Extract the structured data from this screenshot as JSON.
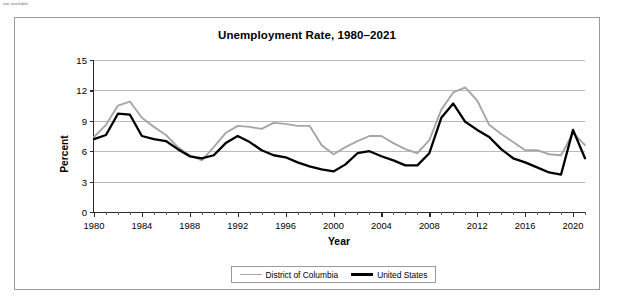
{
  "note": {
    "text": "not available."
  },
  "chart_data": {
    "type": "line",
    "title": "Unemployment Rate, 1980–2021",
    "xlabel": "Year",
    "ylabel": "Percent",
    "xlim": [
      1980,
      2021
    ],
    "ylim": [
      0,
      15
    ],
    "yticks": [
      0,
      3,
      6,
      9,
      12,
      15
    ],
    "xticks": [
      1980,
      1984,
      1988,
      1992,
      1996,
      2000,
      2004,
      2008,
      2012,
      2016,
      2020
    ],
    "xtick_labels": [
      "1980",
      "1984",
      "1988",
      "1992",
      "1996",
      "2000",
      "2004",
      "2008",
      "2012",
      "2016",
      "2020"
    ],
    "ytick_labels": [
      "0",
      "3",
      "6",
      "9",
      "12",
      "15"
    ],
    "grid": "horizontal",
    "legend_position": "bottom-center",
    "x": [
      1980,
      1981,
      1982,
      1983,
      1984,
      1985,
      1986,
      1987,
      1988,
      1989,
      1990,
      1991,
      1992,
      1993,
      1994,
      1995,
      1996,
      1997,
      1998,
      1999,
      2000,
      2001,
      2002,
      2003,
      2004,
      2005,
      2006,
      2007,
      2008,
      2009,
      2010,
      2011,
      2012,
      2013,
      2014,
      2015,
      2016,
      2017,
      2018,
      2019,
      2020,
      2021
    ],
    "series": [
      {
        "name": "District of Columbia",
        "color": "#a6a6a6",
        "values": [
          7.4,
          8.6,
          10.5,
          10.9,
          9.3,
          8.4,
          7.6,
          6.4,
          5.6,
          5.1,
          6.4,
          7.8,
          8.5,
          8.4,
          8.2,
          8.8,
          8.7,
          8.5,
          8.5,
          6.6,
          5.7,
          6.4,
          7.0,
          7.5,
          7.5,
          6.8,
          6.2,
          5.8,
          7.1,
          10.1,
          11.8,
          12.3,
          11.0,
          8.6,
          7.7,
          6.9,
          6.1,
          6.1,
          5.7,
          5.6,
          7.8,
          6.6
        ]
      },
      {
        "name": "United States",
        "color": "#000000",
        "values": [
          7.2,
          7.6,
          9.7,
          9.6,
          7.5,
          7.2,
          7.0,
          6.2,
          5.5,
          5.3,
          5.6,
          6.8,
          7.5,
          6.9,
          6.1,
          5.6,
          5.4,
          4.9,
          4.5,
          4.2,
          4.0,
          4.7,
          5.8,
          6.0,
          5.5,
          5.1,
          4.6,
          4.6,
          5.8,
          9.3,
          10.7,
          8.9,
          8.1,
          7.4,
          6.2,
          5.3,
          4.9,
          4.4,
          3.9,
          3.7,
          8.1,
          5.3
        ]
      }
    ]
  },
  "legend": {
    "entries": [
      {
        "label": "District of Columbia"
      },
      {
        "label": "United States"
      }
    ]
  }
}
